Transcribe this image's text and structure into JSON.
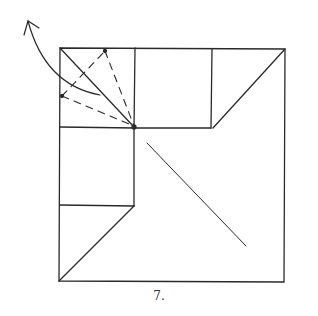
{
  "diagram": {
    "type": "origami-folding-step",
    "step_label": "7.",
    "stroke_color": "#2a2a2a",
    "elements": {
      "outer_square": "square sheet outline",
      "fold_arrow": "curved arrow indicating fold back",
      "valley_folds": "dashed fold lines in top-left square",
      "diagonal_crease": "crease across central area"
    }
  }
}
